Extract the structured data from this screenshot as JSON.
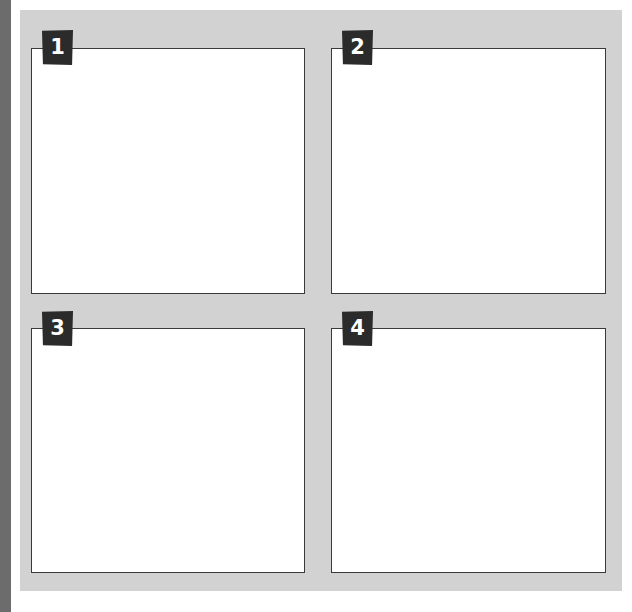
{
  "layout": {
    "background": "#ffffff",
    "strip_color": "#6c6c6c",
    "panel_color": "#d2d2d2",
    "badge_color": "#2b2b2b",
    "box_border_color": "#3a3a3a"
  },
  "panels": [
    {
      "number": "1",
      "content": ""
    },
    {
      "number": "2",
      "content": ""
    },
    {
      "number": "3",
      "content": ""
    },
    {
      "number": "4",
      "content": ""
    }
  ]
}
